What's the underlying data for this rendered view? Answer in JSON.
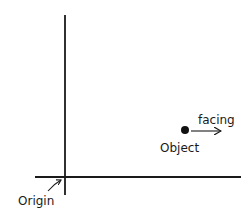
{
  "diagram": {
    "labels": {
      "origin": "Origin",
      "object": "Object",
      "facing": "facing"
    },
    "colors": {
      "stroke": "#1a1a1a",
      "background": "#ffffff"
    },
    "axes": {
      "x_axis": {
        "from": [
          35,
          177
        ],
        "to": [
          241,
          177
        ]
      },
      "y_axis": {
        "from": [
          65,
          15
        ],
        "to": [
          65,
          195
        ]
      }
    },
    "object_point": {
      "x": 185,
      "y": 130
    },
    "facing_arrow": {
      "from": [
        191,
        131
      ],
      "to": [
        222,
        131
      ]
    }
  }
}
